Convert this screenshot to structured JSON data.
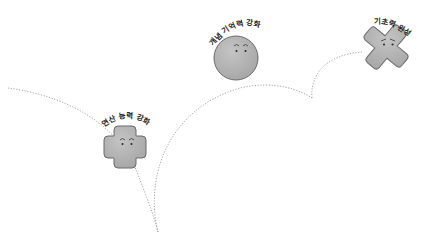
{
  "illustration": {
    "background": "#ffffff",
    "path_color": "#9a9a9a",
    "blob_fill": "#b4b4b4",
    "blob_stroke": "#6a6a6a",
    "stages": [
      {
        "id": "stage-1",
        "label": "연산 능력 강화",
        "shape": "cross",
        "expression": "smiling-eyes"
      },
      {
        "id": "stage-2",
        "label": "개념 기억력 강화",
        "shape": "circle",
        "expression": "raised-brows"
      },
      {
        "id": "stage-3",
        "label": "기초력 완성",
        "shape": "x-cross",
        "expression": "determined"
      }
    ]
  }
}
